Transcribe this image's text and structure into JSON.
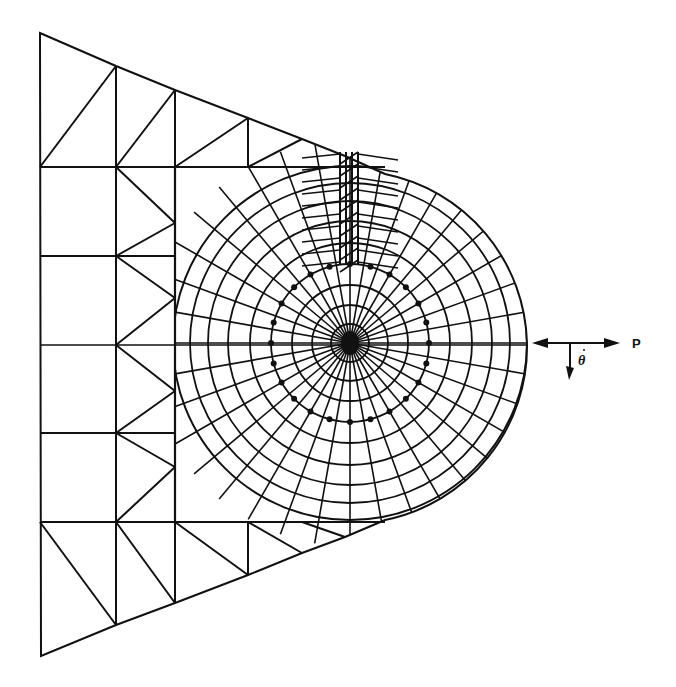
{
  "figure": {
    "labels": {
      "force": "P",
      "rotation": "θ"
    },
    "colors": {
      "line": "#111111",
      "background": "#ffffff"
    }
  },
  "mesh": {
    "outline": {
      "left_top": [
        40,
        33
      ],
      "left_bottom": [
        41,
        656
      ],
      "top_edge": [
        [
          40,
          33
        ],
        [
          116,
          66
        ],
        [
          175,
          90
        ],
        [
          248,
          118
        ],
        [
          302,
          139
        ],
        [
          345,
          156
        ],
        [
          385,
          174
        ]
      ],
      "bottom_edge": [
        [
          41,
          656
        ],
        [
          116,
          625
        ],
        [
          175,
          603
        ],
        [
          248,
          575
        ],
        [
          302,
          553
        ],
        [
          345,
          537
        ],
        [
          385,
          520
        ]
      ]
    },
    "vertical_lines": [
      {
        "x": 116,
        "y1": 66,
        "y2": 625
      },
      {
        "x": 175,
        "y1": 90,
        "y2": 603
      },
      {
        "x": 248,
        "y1": 118,
        "y2": 167
      },
      {
        "x": 248,
        "y1": 522,
        "y2": 575
      }
    ],
    "horizontal_lines": [
      {
        "y": 167,
        "x1": 40,
        "x2": 385
      },
      {
        "y": 256,
        "x1": 40,
        "x2": 175
      },
      {
        "y": 345,
        "x1": 40,
        "x2": 527
      },
      {
        "y": 433,
        "x1": 40,
        "x2": 175
      },
      {
        "y": 522,
        "x1": 40,
        "x2": 385
      }
    ],
    "diagonals": [
      [
        [
          40,
          167
        ],
        [
          116,
          66
        ]
      ],
      [
        [
          116,
          167
        ],
        [
          175,
          90
        ]
      ],
      [
        [
          175,
          167
        ],
        [
          248,
          118
        ]
      ],
      [
        [
          116,
          167
        ],
        [
          175,
          223
        ]
      ],
      [
        [
          175,
          223
        ],
        [
          116,
          256
        ]
      ],
      [
        [
          116,
          256
        ],
        [
          175,
          298
        ]
      ],
      [
        [
          175,
          298
        ],
        [
          116,
          345
        ]
      ],
      [
        [
          116,
          345
        ],
        [
          175,
          391
        ]
      ],
      [
        [
          175,
          391
        ],
        [
          116,
          433
        ]
      ],
      [
        [
          116,
          433
        ],
        [
          175,
          467
        ]
      ],
      [
        [
          175,
          467
        ],
        [
          116,
          522
        ]
      ],
      [
        [
          40,
          522
        ],
        [
          116,
          625
        ]
      ],
      [
        [
          116,
          522
        ],
        [
          175,
          603
        ]
      ],
      [
        [
          175,
          522
        ],
        [
          248,
          575
        ]
      ],
      [
        [
          248,
          522
        ],
        [
          302,
          553
        ]
      ],
      [
        [
          302,
          522
        ],
        [
          345,
          537
        ]
      ],
      [
        [
          248,
          167
        ],
        [
          302,
          139
        ]
      ]
    ],
    "polar": {
      "center": [
        350,
        343
      ],
      "radii": [
        19,
        38,
        58,
        79,
        100,
        122,
        142,
        160,
        177
      ],
      "dot_ring_radius": 79,
      "spokes": 36,
      "outer_clip_note": "rings extend to the wedge boundary"
    },
    "refined_strip": {
      "x_lines": [
        340,
        346,
        352,
        358
      ],
      "y_top": 152,
      "y_bottom": 265
    }
  },
  "arrows": {
    "force_line": {
      "x1": 532,
      "x2": 620,
      "y": 343
    },
    "rotation_arrow": {
      "x": 570,
      "y1": 343,
      "y2": 380
    }
  }
}
